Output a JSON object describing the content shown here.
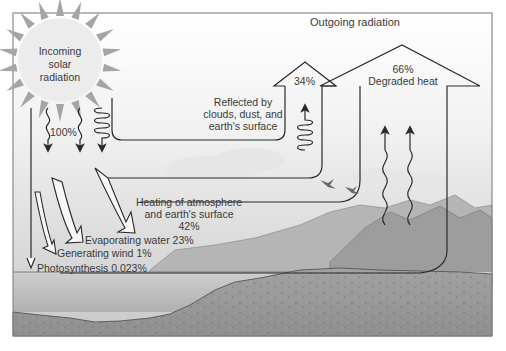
{
  "diagram": {
    "title": "Outgoing radiation",
    "sun": {
      "label_lines": [
        "Incoming",
        "solar",
        "radiation"
      ],
      "input_percent": "100%"
    },
    "reflected": {
      "label_lines": [
        "Reflected by",
        "clouds, dust, and",
        "earth's surface"
      ],
      "percent": "34%"
    },
    "degraded_heat": {
      "percent": "66%",
      "label": "Degraded heat"
    },
    "heating": {
      "label_lines": [
        "Heating of atmosphere",
        "and earth's surface"
      ],
      "percent": "42%"
    },
    "evaporating": {
      "label": "Evaporating water 23%"
    },
    "wind": {
      "label": "Generating wind 1%"
    },
    "photosynthesis": {
      "label": "Photosynthesis 0.023%"
    },
    "colors": {
      "frame": "#8a8a8a",
      "line": "#2a2a2a",
      "sky_top": "#ffffff",
      "sky_bottom": "#cfcfcf",
      "water": "#bdbdbd",
      "ground": "#9a9a9a",
      "mountain": "#a8a8a8",
      "sun": "#e9e9e9",
      "sun_rays": "#a5a5a5"
    }
  }
}
